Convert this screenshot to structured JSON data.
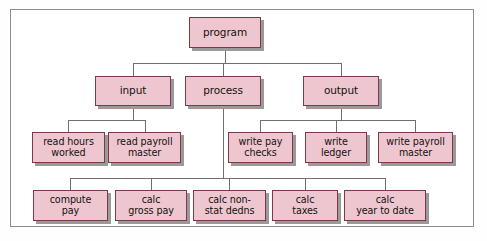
{
  "diagram": {
    "type": "hierarchy-tree",
    "colors": {
      "node_fill": "#eec6d0",
      "node_border": "#7b3a4a",
      "node_shadow": "#9a9a9a",
      "connector": "#6f6f6f",
      "frame_border": "#8d8d8d",
      "background": "#ffffff",
      "text": "#16120f"
    },
    "levels": [
      {
        "level": 1,
        "nodes": [
          {
            "id": "program",
            "label": "program",
            "x": 189,
            "y": 17,
            "w": 72,
            "h": 31
          }
        ]
      },
      {
        "level": 2,
        "nodes": [
          {
            "id": "input",
            "label": "input",
            "x": 95,
            "y": 76,
            "w": 76,
            "h": 30
          },
          {
            "id": "process",
            "label": "process",
            "x": 185,
            "y": 76,
            "w": 76,
            "h": 30
          },
          {
            "id": "output",
            "label": "output",
            "x": 303,
            "y": 76,
            "w": 76,
            "h": 30
          }
        ]
      },
      {
        "level": 3,
        "nodes": [
          {
            "id": "read-hours-worked",
            "label": "read hours\nworked",
            "x": 32,
            "y": 132,
            "w": 73,
            "h": 31
          },
          {
            "id": "read-payroll-master",
            "label": "read payroll\nmaster",
            "x": 108,
            "y": 132,
            "w": 73,
            "h": 31
          },
          {
            "id": "write-pay-checks",
            "label": "write pay\nchecks",
            "x": 228,
            "y": 132,
            "w": 65,
            "h": 31
          },
          {
            "id": "write-ledger",
            "label": "write\nledger",
            "x": 305,
            "y": 132,
            "w": 62,
            "h": 31
          },
          {
            "id": "write-payroll-master",
            "label": "write payroll\nmaster",
            "x": 378,
            "y": 132,
            "w": 75,
            "h": 31
          }
        ]
      },
      {
        "level": 4,
        "nodes": [
          {
            "id": "compute-pay",
            "label": "compute\npay",
            "x": 33,
            "y": 190,
            "w": 75,
            "h": 31
          },
          {
            "id": "calc-gross-pay",
            "label": "calc\ngross pay",
            "x": 115,
            "y": 190,
            "w": 72,
            "h": 31
          },
          {
            "id": "calc-non-stat-dedns",
            "label": "calc non-\nstat dedns",
            "x": 193,
            "y": 190,
            "w": 73,
            "h": 31
          },
          {
            "id": "calc-taxes",
            "label": "calc\ntaxes",
            "x": 272,
            "y": 190,
            "w": 66,
            "h": 31
          },
          {
            "id": "calc-year-to-date",
            "label": "calc\nyear to date",
            "x": 344,
            "y": 190,
            "w": 82,
            "h": 31
          }
        ]
      }
    ],
    "connections": [
      {
        "from": "program",
        "to": "input"
      },
      {
        "from": "program",
        "to": "process"
      },
      {
        "from": "program",
        "to": "output"
      },
      {
        "from": "input",
        "to": "read-hours-worked"
      },
      {
        "from": "input",
        "to": "read-payroll-master"
      },
      {
        "from": "output",
        "to": "write-pay-checks"
      },
      {
        "from": "output",
        "to": "write-ledger"
      },
      {
        "from": "output",
        "to": "write-payroll-master"
      },
      {
        "from": "process",
        "to": "compute-pay"
      },
      {
        "from": "process",
        "to": "calc-gross-pay"
      },
      {
        "from": "process",
        "to": "calc-non-stat-dedns"
      },
      {
        "from": "process",
        "to": "calc-taxes"
      },
      {
        "from": "process",
        "to": "calc-year-to-date"
      }
    ]
  }
}
